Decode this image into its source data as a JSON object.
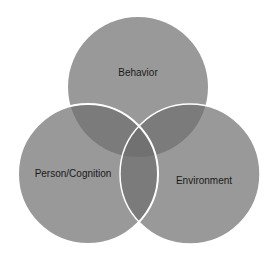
{
  "diagram": {
    "type": "venn",
    "circles": [
      {
        "id": "behavior",
        "label": "Behavior",
        "cx": 138,
        "cy": 87,
        "r": 70,
        "label_x": 138,
        "label_y": 72,
        "outline": false
      },
      {
        "id": "person",
        "label": "Person/Cognition",
        "cx": 88,
        "cy": 174,
        "r": 70,
        "label_x": 73,
        "label_y": 173,
        "outline": true
      },
      {
        "id": "environment",
        "label": "Environment",
        "cx": 190,
        "cy": 174,
        "r": 70,
        "label_x": 204,
        "label_y": 180,
        "outline": true
      }
    ],
    "colors": {
      "fill": "#6e6e6e",
      "fill_opacity": 0.7,
      "outline": "#ffffff",
      "text": "#1a1a1a",
      "background": "#ffffff"
    }
  }
}
